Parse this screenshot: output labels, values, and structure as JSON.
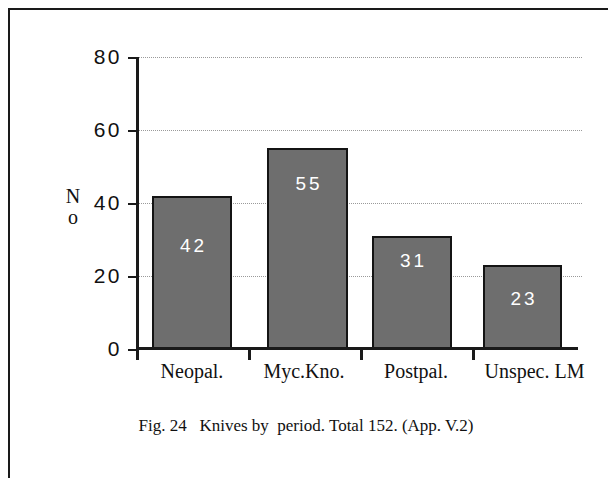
{
  "caption": "Fig. 24   Knives by  period. Total 152. (App. V.2)",
  "chart_data": {
    "type": "bar",
    "title": "",
    "xlabel": "",
    "ylabel": "No",
    "categories": [
      "Neopal.",
      "Myc.Kno.",
      "Postpal.",
      "Unspec. LM"
    ],
    "values": [
      42,
      55,
      31,
      23
    ],
    "ylim": [
      0,
      80
    ],
    "yticks": [
      0,
      20,
      40,
      60,
      80
    ],
    "ytick_labels": [
      "0",
      "20",
      "40",
      "60",
      "80"
    ],
    "grid": true,
    "grid_axis": "y",
    "legend": false,
    "bar_color": "#6e6e6e",
    "bar_edge_color": "#141414",
    "value_label_color": "#ffffff",
    "total": 152
  }
}
